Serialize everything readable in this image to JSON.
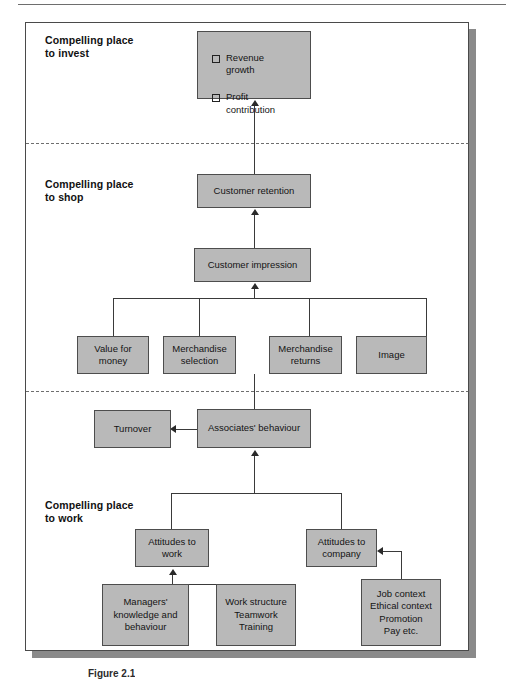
{
  "figure": {
    "caption": "Figure 2.1",
    "frame_color": "#4a4a4a",
    "node_fill": "#b9b9b9",
    "node_border": "#4d4d4d",
    "connector_color": "#3a3a3a"
  },
  "bands": [
    {
      "id": "invest",
      "label": "Compelling place\nto invest"
    },
    {
      "id": "shop",
      "label": "Compelling place\nto shop"
    },
    {
      "id": "work",
      "label": "Compelling place\nto work"
    }
  ],
  "nodes": {
    "outcomes": {
      "bullets": [
        {
          "marker": "checkbox-square",
          "text": "Revenue\ngrowth"
        },
        {
          "marker": "checkbox-square",
          "text": "Profit\ncontribution"
        }
      ]
    },
    "customer_retention": "Customer retention",
    "customer_impression": "Customer impression",
    "value_for_money": "Value for\nmoney",
    "merchandise_selection": "Merchandise\nselection",
    "merchandise_returns": "Merchandise\nreturns",
    "image": "Image",
    "turnover": "Turnover",
    "associates_behaviour": "Associates' behaviour",
    "attitudes_to_work": "Attitudes to\nwork",
    "attitudes_to_company": "Attitudes to\ncompany",
    "managers_knowledge": "Managers'\nknowledge and\nbehaviour",
    "work_structure": "Work structure\nTeamwork\nTraining",
    "job_context": "Job context\nEthical context\nPromotion\nPay etc."
  }
}
